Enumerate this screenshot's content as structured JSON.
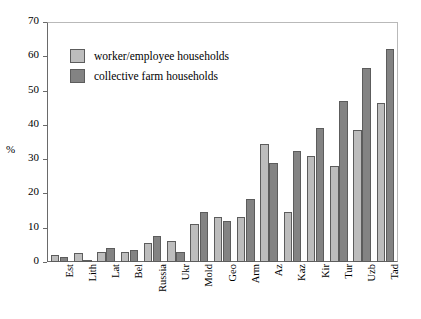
{
  "chart_data": {
    "type": "bar",
    "title": "",
    "xlabel": "",
    "ylabel": "%",
    "ylim": [
      0,
      70
    ],
    "yticks": [
      0,
      10,
      20,
      30,
      40,
      50,
      60,
      70
    ],
    "grid": false,
    "legend_position": "top-left-inside",
    "categories": [
      "Est",
      "Lith",
      "Lat",
      "Bel",
      "Russia",
      "Ukr",
      "Mold",
      "Geo",
      "Arm",
      "Az",
      "Kaz",
      "Kir",
      "Tur",
      "Uzb",
      "Tad"
    ],
    "series": [
      {
        "name": "worker/employee households",
        "color": "#bdbdbd",
        "values": [
          2,
          2.5,
          3,
          3,
          5.5,
          6,
          11,
          13,
          13,
          34.5,
          14.5,
          31,
          28,
          38.5,
          46.5
        ]
      },
      {
        "name": "collective farm households",
        "color": "#838383",
        "values": [
          1.5,
          0.5,
          4,
          3.5,
          7.5,
          3,
          14.5,
          12,
          18.5,
          29,
          32.5,
          39,
          47,
          56.5,
          62
        ]
      }
    ]
  },
  "axis": {
    "y_label": "%",
    "y_tick_labels": [
      "0",
      "10",
      "20",
      "30",
      "40",
      "50",
      "60",
      "70"
    ]
  },
  "legend": {
    "items": [
      {
        "label": "worker/employee households",
        "swatch": "light"
      },
      {
        "label": "collective farm households",
        "swatch": "dark"
      }
    ]
  }
}
